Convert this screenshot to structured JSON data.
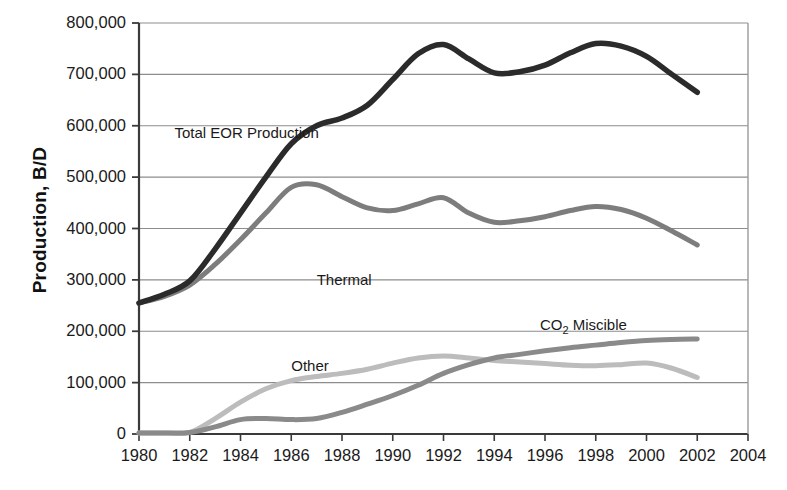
{
  "chart_data": {
    "type": "line",
    "title": "",
    "xlabel": "",
    "ylabel": "Production, B/D",
    "xlim": [
      1980,
      2004
    ],
    "ylim": [
      0,
      800000
    ],
    "grid": true,
    "legend_position": "inline-annotations",
    "x_ticks": [
      "1980",
      "1982",
      "1984",
      "1986",
      "1988",
      "1990",
      "1992",
      "1994",
      "1996",
      "1998",
      "2000",
      "2002",
      "2004"
    ],
    "x_tick_values": [
      1980,
      1982,
      1984,
      1986,
      1988,
      1990,
      1992,
      1994,
      1996,
      1998,
      2000,
      2002,
      2004
    ],
    "y_ticks": [
      "0",
      "100,000",
      "200,000",
      "300,000",
      "400,000",
      "500,000",
      "600,000",
      "700,000",
      "800,000"
    ],
    "y_tick_values": [
      0,
      100000,
      200000,
      300000,
      400000,
      500000,
      600000,
      700000,
      800000
    ],
    "x": [
      1980,
      1981,
      1982,
      1983,
      1984,
      1985,
      1986,
      1987,
      1988,
      1989,
      1990,
      1991,
      1992,
      1993,
      1994,
      1995,
      1996,
      1997,
      1998,
      1999,
      2000,
      2001,
      2002
    ],
    "series": [
      {
        "name": "Total EOR Production",
        "color": "#2b2b2b",
        "width": 5.5,
        "label_x": 1981.4,
        "label_y": 585000,
        "values": [
          255000,
          272000,
          298000,
          360000,
          430000,
          500000,
          565000,
          600000,
          615000,
          640000,
          690000,
          740000,
          758000,
          730000,
          703000,
          705000,
          718000,
          742000,
          760000,
          755000,
          735000,
          700000,
          665000
        ]
      },
      {
        "name": "Thermal",
        "color": "#7d7d7d",
        "width": 5.0,
        "label_x": 1987.0,
        "label_y": 300000,
        "values": [
          255000,
          268000,
          290000,
          330000,
          378000,
          430000,
          480000,
          485000,
          462000,
          440000,
          435000,
          448000,
          460000,
          430000,
          412000,
          415000,
          423000,
          435000,
          443000,
          437000,
          420000,
          395000,
          368000
        ]
      },
      {
        "name": "CO2 Miscible",
        "color": "#8a8a8a",
        "width": 5.0,
        "label_x": 1995.8,
        "label_y": 213000,
        "values": [
          2000,
          2000,
          3000,
          14000,
          28000,
          30000,
          28000,
          30000,
          42000,
          58000,
          75000,
          95000,
          118000,
          135000,
          148000,
          155000,
          162000,
          168000,
          173000,
          178000,
          182000,
          184000,
          185000
        ]
      },
      {
        "name": "Other",
        "color": "#bcbcbc",
        "width": 5.0,
        "label_x": 1986.0,
        "label_y": 132000,
        "values": [
          2000,
          2000,
          3000,
          30000,
          62000,
          88000,
          104000,
          112000,
          118000,
          126000,
          138000,
          148000,
          152000,
          148000,
          143000,
          140000,
          137000,
          134000,
          133000,
          135000,
          138000,
          128000,
          110000
        ]
      }
    ],
    "annotations": [
      {
        "text": "Total EOR Production",
        "x": 1981.4,
        "y": 585000
      },
      {
        "text": "Thermal",
        "x": 1987.0,
        "y": 300000
      },
      {
        "text": "CO",
        "sub": "2",
        "text2": " Miscible",
        "x": 1995.8,
        "y": 213000
      },
      {
        "text": "Other",
        "x": 1986.0,
        "y": 132000
      }
    ]
  },
  "axis": {
    "y_title": "Production, B/D"
  }
}
